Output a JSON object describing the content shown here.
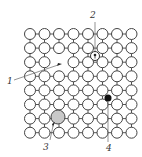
{
  "diagram": {
    "type": "crystal-lattice-point-defects",
    "lattice": {
      "columns": 8,
      "rows": 8
    },
    "vacancy": {
      "col": 2,
      "row": 2
    },
    "labels": [
      {
        "id": "1",
        "text": "1",
        "meaning": "vacancy"
      },
      {
        "id": "2",
        "text": "2",
        "meaning": "interstitial atom (own)"
      },
      {
        "id": "3",
        "text": "3",
        "meaning": "substitutional large impurity atom"
      },
      {
        "id": "4",
        "text": "4",
        "meaning": "interstitial impurity atom"
      }
    ],
    "colors": {
      "atom_fill": "#ffffff",
      "atom_stroke": "#444444",
      "substitutional_fill": "#c8c8c8",
      "interstitial_impurity_fill": "#111111"
    }
  }
}
